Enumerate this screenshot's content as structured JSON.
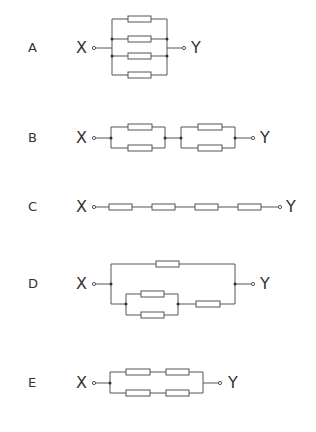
{
  "options": [
    {
      "letter": "A",
      "x_label": "X",
      "y_label": "Y",
      "description": "four resistors in parallel"
    },
    {
      "letter": "B",
      "x_label": "X",
      "y_label": "Y",
      "description": "two parallel pairs in series"
    },
    {
      "letter": "C",
      "x_label": "X",
      "y_label": "Y",
      "description": "four resistors in series"
    },
    {
      "letter": "D",
      "x_label": "X",
      "y_label": "Y",
      "description": "one resistor parallel with (parallel pair in series with one resistor)"
    },
    {
      "letter": "E",
      "x_label": "X",
      "y_label": "Y",
      "description": "two series pairs in parallel"
    }
  ],
  "colors": {
    "wire": "#555555",
    "resistor_fill": "#ffffff",
    "text": "#333333"
  }
}
